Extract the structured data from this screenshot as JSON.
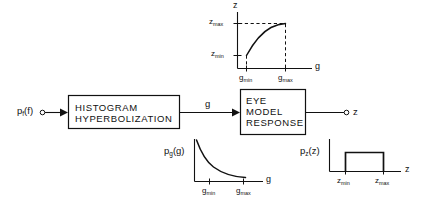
{
  "figure": {
    "type": "block-diagram",
    "background": "#ffffff",
    "ink": "#111111"
  },
  "blocks": [
    {
      "id": "histogram-hyperbolization",
      "lines": [
        "HISTOGRAM",
        "HYPERBOLIZATION"
      ],
      "line1": "HISTOGRAM",
      "line2": "HYPERBOLIZATION",
      "x": 68,
      "y": 95,
      "w": 112,
      "h": 34
    },
    {
      "id": "eye-model-response",
      "lines": [
        "EYE",
        "MODEL",
        "RESPONSE"
      ],
      "line1": "EYE",
      "line2": "MODEL",
      "line3": "RESPONSE",
      "x": 240,
      "y": 89,
      "w": 66,
      "h": 45
    }
  ],
  "signals": {
    "input": {
      "base": "p",
      "subscript": "f",
      "arg": "(f)",
      "full": "p_f(f)"
    },
    "intermediate": {
      "label": "g"
    },
    "output": {
      "label": "z"
    }
  },
  "charts": {
    "transfer": {
      "type": "line",
      "title": "",
      "xlabel": "g",
      "ylabel": "z",
      "xticks": [
        "g_min",
        "g_max"
      ],
      "xtick_labels": [
        {
          "base": "g",
          "subscript": "min"
        },
        {
          "base": "g",
          "subscript": "max"
        }
      ],
      "ytick_labels": [
        {
          "base": "z",
          "subscript": "max"
        },
        {
          "base": "z",
          "subscript": "min"
        }
      ],
      "yticks": [
        "z_max",
        "z_min"
      ],
      "description": "Monotonic saturating curve rising from (g_min, z_min) to (g_max, z_max)",
      "dashed_guides": [
        "horizontal at z_max",
        "vertical at g_min",
        "vertical at g_max"
      ],
      "x": [
        0.0,
        0.08,
        0.18,
        0.3,
        0.45,
        0.62,
        0.8,
        1.0
      ],
      "y": [
        0.0,
        0.2,
        0.38,
        0.55,
        0.71,
        0.84,
        0.93,
        1.0
      ],
      "xlim": [
        0,
        1
      ],
      "ylim": [
        0,
        1
      ],
      "grid": false
    },
    "pg": {
      "type": "line",
      "title": "",
      "ylabel": "p_g(g)",
      "ylabel_parts": {
        "base": "p",
        "subscript": "g",
        "arg": "(g)"
      },
      "xlabel": "g",
      "xticks": [
        "g_min",
        "g_max"
      ],
      "xtick_labels": [
        {
          "base": "g",
          "subscript": "min"
        },
        {
          "base": "g",
          "subscript": "max"
        }
      ],
      "description": "Hyperbolic (1/g) decaying density between g_min and g_max",
      "x": [
        0.0,
        0.08,
        0.18,
        0.3,
        0.45,
        0.62,
        0.8,
        1.0
      ],
      "y": [
        1.0,
        0.72,
        0.53,
        0.4,
        0.31,
        0.25,
        0.21,
        0.18
      ],
      "xlim": [
        0,
        1
      ],
      "ylim": [
        0,
        1
      ],
      "grid": false
    },
    "pz": {
      "type": "line",
      "title": "",
      "ylabel": "p_z(z)",
      "ylabel_parts": {
        "base": "p",
        "subscript": "z",
        "arg": "(z)"
      },
      "xlabel": "z",
      "xticks": [
        "z_min",
        "z_max"
      ],
      "xtick_labels": [
        {
          "base": "z",
          "subscript": "min"
        },
        {
          "base": "z",
          "subscript": "max"
        }
      ],
      "description": "Uniform (rectangular) density between z_min and z_max",
      "x": [
        0.18,
        0.18,
        0.82,
        0.82
      ],
      "y": [
        0.0,
        1.0,
        1.0,
        0.0
      ],
      "xlim": [
        0,
        1
      ],
      "ylim": [
        0,
        1
      ],
      "grid": false
    }
  }
}
